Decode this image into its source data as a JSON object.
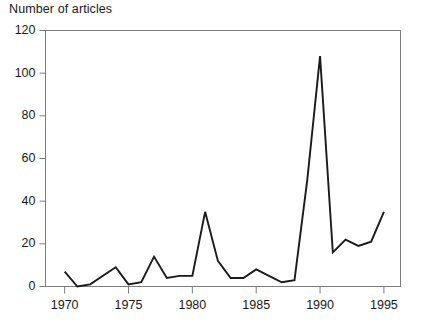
{
  "chart_data": {
    "type": "line",
    "title": "Number of articles",
    "ylabel": "Number of articles",
    "xlabel": "",
    "grid": false,
    "legend": false,
    "legend_position": "none",
    "xlim": [
      1968.5,
      1996.3
    ],
    "ylim": [
      0,
      120
    ],
    "yticks": [
      0,
      20,
      40,
      60,
      80,
      100,
      120
    ],
    "ytick_labels": [
      "0",
      "20",
      "40",
      "60",
      "80",
      "100",
      "120"
    ],
    "xticks": [
      1970,
      1975,
      1980,
      1985,
      1990,
      1995
    ],
    "xtick_labels": [
      "1970",
      "1975",
      "1980",
      "1985",
      "1990",
      "1995"
    ],
    "x": [
      1970,
      1971,
      1972,
      1973,
      1974,
      1975,
      1976,
      1977,
      1978,
      1979,
      1980,
      1981,
      1982,
      1983,
      1984,
      1985,
      1986,
      1987,
      1988,
      1989,
      1990,
      1991,
      1992,
      1993,
      1994,
      1995
    ],
    "values": [
      7,
      0,
      1,
      5,
      9,
      1,
      2,
      14,
      4,
      5,
      5,
      35,
      12,
      4,
      4,
      8,
      5,
      2,
      3,
      50,
      108,
      16,
      22,
      19,
      21,
      35
    ],
    "series": [
      {
        "name": "Number of articles",
        "color": "#1a1a1a",
        "values": [
          7,
          0,
          1,
          5,
          9,
          1,
          2,
          14,
          4,
          5,
          5,
          35,
          12,
          4,
          4,
          8,
          5,
          2,
          3,
          50,
          108,
          16,
          22,
          19,
          21,
          35
        ]
      }
    ]
  },
  "style": {
    "line_color": "#1a1a1a",
    "frame_color": "#7d7d7d",
    "text_color": "#181818",
    "background": "#ffffff"
  }
}
